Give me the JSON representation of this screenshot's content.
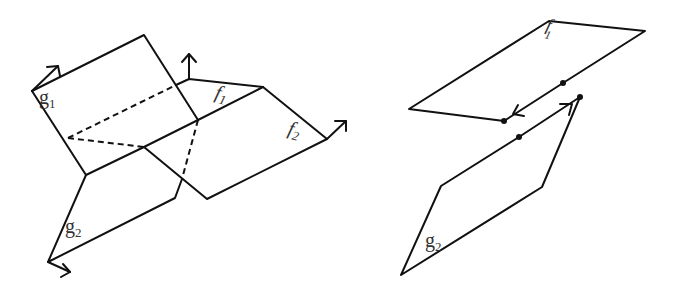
{
  "diagram": {
    "left_figure": {
      "labels": {
        "g1_main": "g",
        "g1_sub": "1",
        "g2_main": "g",
        "g2_sub": "2",
        "f1_main": "f",
        "f1_sub": "1",
        "f2_main": "f",
        "f2_sub": "2"
      },
      "faces": [
        "g1",
        "f1",
        "f2",
        "g2"
      ],
      "normal_arrows": 4,
      "dashed_hidden_edges": 3
    },
    "right_figure": {
      "labels": {
        "f1_main": "f",
        "f1_sub": "1",
        "g2_main": "g",
        "g2_sub": "2"
      },
      "faces": [
        "f1",
        "g2"
      ],
      "marked_points": 4,
      "edge_orientation_arrows": 2
    },
    "colors": {
      "stroke": "#111111",
      "label": "#333333",
      "background": "#ffffff"
    }
  }
}
